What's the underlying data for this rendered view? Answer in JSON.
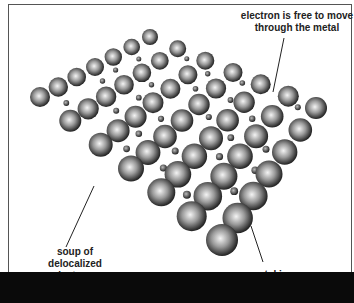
{
  "diagram": {
    "labels": {
      "electron_free": [
        "electron is free to move",
        "through the metal"
      ],
      "soup": [
        "soup of",
        "delocalized",
        "electrons"
      ],
      "metal_ion": "metal ion"
    },
    "lattice": {
      "rows": 7,
      "cols": 7,
      "corners": {
        "top": [
          150,
          37,
          8
        ],
        "right": [
          316,
          108,
          11
        ],
        "left": [
          40,
          97,
          10
        ],
        "bottom": [
          222,
          240,
          16
        ]
      },
      "ion_color_light": "#f2f2f2",
      "ion_color_dark": "#1a1a1a",
      "electron_color": "#333333"
    },
    "colors": {
      "background": "#ffffff",
      "frame_border": "#555555",
      "bottom_bar": "#0a0a0a",
      "label_text": "#222222",
      "pointer_line": "#222222"
    }
  }
}
